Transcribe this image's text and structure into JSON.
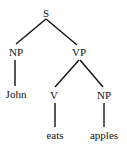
{
  "diagram": {
    "type": "parse-tree",
    "nodes": [
      {
        "id": "S",
        "label": "S",
        "x": 46,
        "y": 13
      },
      {
        "id": "NP1",
        "label": "NP",
        "x": 16,
        "y": 52
      },
      {
        "id": "VP",
        "label": "VP",
        "x": 79,
        "y": 52
      },
      {
        "id": "John",
        "label": "John",
        "x": 16,
        "y": 94
      },
      {
        "id": "V",
        "label": "V",
        "x": 54,
        "y": 95
      },
      {
        "id": "NP2",
        "label": "NP",
        "x": 104,
        "y": 95
      },
      {
        "id": "eats",
        "label": "eats",
        "x": 55,
        "y": 135
      },
      {
        "id": "apples",
        "label": "apples",
        "x": 104,
        "y": 135
      }
    ],
    "edges": [
      {
        "from": "S",
        "to": "NP1",
        "x1": 46,
        "y1": 19,
        "x2": 16,
        "y2": 44
      },
      {
        "from": "S",
        "to": "VP",
        "x1": 46,
        "y1": 19,
        "x2": 77,
        "y2": 45
      },
      {
        "from": "NP1",
        "to": "John",
        "x1": 15,
        "y1": 60,
        "x2": 15,
        "y2": 86
      },
      {
        "from": "VP",
        "to": "V",
        "x1": 79,
        "y1": 60,
        "x2": 55,
        "y2": 87
      },
      {
        "from": "VP",
        "to": "NP2",
        "x1": 80,
        "y1": 60,
        "x2": 103,
        "y2": 87
      },
      {
        "from": "V",
        "to": "eats",
        "x1": 55,
        "y1": 103,
        "x2": 55,
        "y2": 127
      },
      {
        "from": "NP2",
        "to": "apples",
        "x1": 104,
        "y1": 103,
        "x2": 104,
        "y2": 127
      }
    ]
  }
}
